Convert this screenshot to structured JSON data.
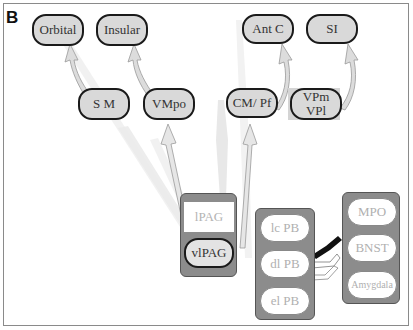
{
  "panel_label": "B",
  "colors": {
    "node_fill": "#d9d9d9",
    "node_border": "#1a1a1a",
    "group_fill": "#8c8c8c",
    "arrow_fill": "#e3e3e3",
    "ghost_text": "#b0b0b0"
  },
  "cortical_targets": [
    {
      "id": "orbital",
      "label": "Orbital"
    },
    {
      "id": "insular",
      "label": "Insular"
    },
    {
      "id": "antc",
      "label": "Ant C"
    },
    {
      "id": "si",
      "label": "SI"
    }
  ],
  "thalamic_relays": [
    {
      "id": "sm",
      "label": "S M"
    },
    {
      "id": "vmpo",
      "label": "VMpo"
    },
    {
      "id": "cmpf",
      "label": "CM/ Pf"
    },
    {
      "id": "vpm_vpl",
      "label_line1": "VPm",
      "label_line2": "VPl"
    }
  ],
  "pag_group": {
    "lpag": "lPAG",
    "vlpag": "vlPAG"
  },
  "pb_group": [
    {
      "id": "lcpb",
      "label": "lc PB"
    },
    {
      "id": "dlpb",
      "label": "dl PB"
    },
    {
      "id": "elpb",
      "label": "el PB"
    }
  ],
  "forebrain_group": [
    {
      "id": "mpo",
      "label": "MPO"
    },
    {
      "id": "bnst",
      "label": "BNST"
    },
    {
      "id": "amygdala",
      "label": "Amygdala"
    }
  ],
  "connections": [
    {
      "from": "S M",
      "to": "Orbital"
    },
    {
      "from": "VMpo",
      "to": "Insular"
    },
    {
      "from": "CM/ Pf",
      "to": "Ant C"
    },
    {
      "from": "VPm VPl",
      "to": "SI"
    },
    {
      "from": "vlPAG",
      "to": "VMpo"
    },
    {
      "from": "vlPAG",
      "to": "CM/ Pf"
    },
    {
      "from": "vlPAG",
      "to": "S M"
    },
    {
      "from": "lPAG",
      "to": "CM/ Pf"
    },
    {
      "from": "dl PB",
      "to": "BNST"
    }
  ]
}
